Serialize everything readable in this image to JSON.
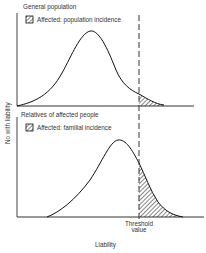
{
  "diagram": {
    "type": "liability-threshold model",
    "y_axis_label": "No with liability",
    "x_axis_label": "Liability",
    "threshold_label_line1": "Threshold",
    "threshold_label_line2": "value",
    "panels": [
      {
        "title": "General population",
        "legend": "Affected: population incidence",
        "description": "Normal distribution centered well left of threshold; small shaded tail beyond threshold"
      },
      {
        "title": "Relatives of affected people",
        "legend": "Affected: familial incidence",
        "description": "Distribution shifted right toward threshold; larger shaded tail beyond threshold"
      }
    ],
    "colors": {
      "line": "#111111",
      "background": "#ffffff",
      "text": "#333333"
    }
  }
}
